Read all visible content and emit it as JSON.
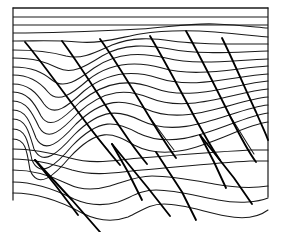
{
  "figure": {
    "line_color": "#1a1a1a",
    "fault_color": "#000000",
    "background_color": "#ffffff"
  },
  "frame": {
    "left": 13,
    "right": 268,
    "top": 8,
    "bottom_left": 200,
    "bottom_right": 197
  },
  "undeformed_beds": [
    {
      "name": "top-bed-1",
      "d": "M13,8 L268,8"
    },
    {
      "name": "top-bed-2",
      "d": "M13,17 L268,17"
    },
    {
      "name": "top-bed-3",
      "d": "M13,25 L268,25"
    },
    {
      "name": "unconformity",
      "d": "M13,33 C60,33 100,31 140,29 C170,27 190,23 215,24 C240,25 255,27 268,28"
    }
  ],
  "folded_beds": [
    {
      "name": "bed-a",
      "d": "M13,41 C40,41 58,40 78,42 C100,44 118,38 140,34 C165,30 190,30 215,32 C240,34 256,36 268,37"
    },
    {
      "name": "bed-b",
      "d": "M13,50 C38,50 52,52 66,56 C82,60 96,52 112,45 C132,37 152,38 172,41 C200,45 232,44 268,44"
    },
    {
      "name": "bed-c",
      "d": "M13,58 C34,58 46,62 58,68 C72,75 86,66 102,56 C124,43 148,45 170,49 C200,55 234,52 268,51"
    },
    {
      "name": "bed-d",
      "d": "M13,67 C32,67 42,72 52,80 C64,90 78,80 94,68 C118,51 144,53 166,58 C198,66 234,60 268,59"
    },
    {
      "name": "bed-e",
      "d": "M13,75 C30,75 40,82 48,92 C58,104 72,94 88,80 C112,61 140,62 162,68 C196,78 234,68 268,66"
    },
    {
      "name": "bed-f",
      "d": "M13,84 C28,84 36,92 44,104 C54,118 68,106 84,91 C110,70 136,71 158,78 C194,90 234,76 268,74"
    },
    {
      "name": "bed-g",
      "d": "M13,92 C27,92 34,102 41,116 C50,131 64,118 80,102 C108,79 132,80 154,88 C190,102 234,84 268,81"
    },
    {
      "name": "bed-h",
      "d": "M13,101 C26,101 32,112 39,127 C48,143 62,130 78,113 C106,88 128,89 150,98 C188,114 234,92 268,89"
    },
    {
      "name": "bed-i",
      "d": "M13,110 C26,110 30,122 36,138 C45,155 60,142 76,124 C104,97 124,99 146,109 C186,127 234,100 268,97"
    },
    {
      "name": "bed-j",
      "d": "M13,119 C26,119 29,132 34,149 C43,167 58,153 74,135 C102,107 120,110 142,121 C184,141 234,108 268,105"
    },
    {
      "name": "bed-k",
      "d": "M13,129 C26,129 28,142 32,160 C40,179 56,165 72,146 C100,117 116,121 138,133 C182,155 234,117 268,113"
    },
    {
      "name": "bed-l",
      "d": "M13,139 C26,139 27,152 30,170 C38,190 54,176 70,157 C98,127 112,132 134,145 C180,169 234,126 268,122"
    },
    {
      "name": "bed-m",
      "d": "M13,149 C28,149 48,152 70,158 C94,165 116,160 140,158 C176,155 214,152 250,150 C258,150 264,150 268,150"
    },
    {
      "name": "bed-n",
      "d": "M13,159 C30,159 50,163 72,170 C96,177 118,172 142,170 C178,167 214,163 250,161 C258,161 264,161 268,161"
    },
    {
      "name": "bed-o",
      "d": "M13,170 C34,170 52,176 68,184 C82,191 96,190 110,186 C124,182 136,176 152,176 C172,176 192,180 214,184 C236,188 256,188 268,186"
    },
    {
      "name": "bed-p",
      "d": "M13,182 C36,182 56,190 74,199 C90,206 104,206 118,202 C130,198 140,190 156,190 C176,190 196,196 218,200 C240,204 258,202 268,198"
    },
    {
      "name": "bed-q",
      "d": "M13,193 C40,193 62,202 82,213 C100,222 114,222 128,217 C140,212 148,204 164,204 C184,204 204,212 226,216 C246,220 260,216 268,210"
    }
  ],
  "thrust_faults": [
    {
      "name": "fault-1",
      "d": "M25,42 C42,62 66,96 90,128 C104,146 114,158 120,165"
    },
    {
      "name": "fault-2",
      "d": "M62,41 C78,62 100,98 122,130 C134,148 142,158 147,164"
    },
    {
      "name": "fault-3",
      "d": "M100,39 C114,58 132,88 150,118 C162,138 170,150 176,158"
    },
    {
      "name": "fault-4",
      "d": "M150,36 C162,56 178,86 194,116 C206,138 214,152 220,160"
    },
    {
      "name": "fault-5",
      "d": "M186,31 C198,52 214,84 230,116 C242,140 250,154 256,162"
    },
    {
      "name": "fault-6",
      "d": "M222,38 C232,58 244,86 256,112 C262,126 266,134 268,140"
    }
  ],
  "ramp_anticlines": [
    {
      "name": "ramp-tip-1",
      "d": "M35,160 L72,200 L100,232"
    },
    {
      "name": "ramp-tip-1-back",
      "d": "M35,160 L56,186 L78,215"
    },
    {
      "name": "ramp-tip-2",
      "d": "M112,144 L148,188 L170,216"
    },
    {
      "name": "ramp-tip-2-back",
      "d": "M112,144 L128,172 L142,200"
    },
    {
      "name": "ramp-tip-3",
      "d": "M200,135 L234,178 L252,204"
    },
    {
      "name": "ramp-tip-3-back",
      "d": "M200,135 L214,162 L226,188"
    },
    {
      "name": "ramp-tip-4",
      "d": "M156,152 L182,192 L196,220"
    }
  ],
  "fold_hinges": [
    {
      "name": "hinge-left",
      "d": "M90,128 C96,136 102,144 108,150"
    },
    {
      "name": "hinge-mid",
      "d": "M150,118 C158,128 166,140 174,150"
    },
    {
      "name": "hinge-right",
      "d": "M230,116 C238,128 246,142 254,154"
    }
  ]
}
